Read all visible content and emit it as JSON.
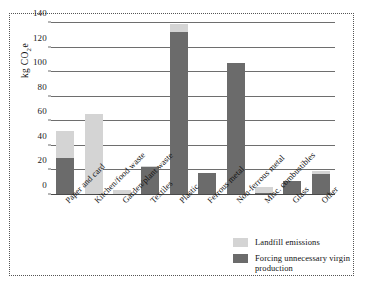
{
  "chart_data": {
    "type": "bar",
    "stacked": true,
    "title": "",
    "xlabel": "",
    "ylabel": "kg CO2e",
    "ylabel_parts": {
      "prefix": "kg CO",
      "sub": "2",
      "suffix": "e"
    },
    "ylim": [
      0,
      140
    ],
    "yticks": [
      0,
      20,
      40,
      60,
      80,
      100,
      120,
      140
    ],
    "ytick_labels": [
      "0",
      "20",
      "40",
      "60",
      "80",
      "100",
      "120",
      "140"
    ],
    "grid": true,
    "grid_axis": "y",
    "legend_position": "bottom-right",
    "categories": [
      "Paper and card",
      "Kitchen/food waste",
      "Garden/plant waste",
      "Textiles",
      "Plastic",
      "Ferrous metal",
      "Non-ferrous metal",
      "Misc. combustibles",
      "Glass",
      "Other"
    ],
    "series": [
      {
        "name": "Forcing unnecessary virgin production",
        "color": "#6b6b6b",
        "values": [
          29,
          0,
          0,
          22,
          132,
          17.5,
          107,
          1,
          11,
          16
        ]
      },
      {
        "name": "Landfill emissions",
        "color": "#d4d4d4",
        "values": [
          22,
          65,
          3,
          1,
          6,
          0,
          0,
          5,
          0,
          3
        ]
      }
    ],
    "totals": [
      51,
      65,
      3,
      23,
      138,
      17.5,
      107,
      6,
      11,
      19
    ]
  },
  "legend": {
    "items": [
      {
        "label": "Landfill emissions",
        "color": "#d4d4d4"
      },
      {
        "label": "Forcing unnecessary virgin production",
        "color": "#6b6b6b"
      }
    ]
  },
  "colors": {
    "landfill": "#d4d4d4",
    "virgin": "#6b6b6b",
    "gridline": "#6e6e6e",
    "frame": "#555555",
    "background": "#ffffff"
  }
}
